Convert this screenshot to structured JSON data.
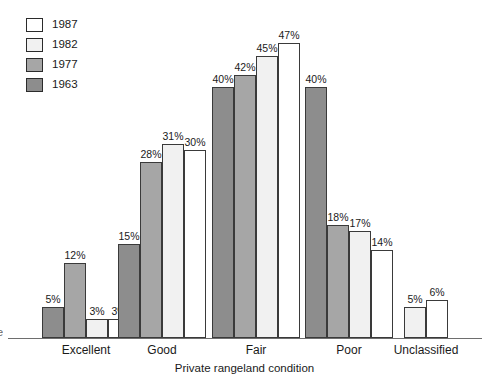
{
  "chart_data": {
    "type": "bar",
    "title": "",
    "xlabel": "Private rangeland condition",
    "ylabel": "",
    "grid": false,
    "legend_position": "top-left",
    "ylim": [
      0,
      50
    ],
    "value_suffix": "%",
    "categories": [
      "Excellent",
      "Good",
      "Fair",
      "Poor",
      "Unclassified"
    ],
    "series": [
      {
        "name": "1963",
        "color": "#8d8d8d",
        "values": [
          5,
          15,
          40,
          40,
          null
        ],
        "labels": [
          "5%",
          "15%",
          "40%",
          "40%",
          ""
        ]
      },
      {
        "name": "1977",
        "color": "#a6a6a6",
        "values": [
          12,
          28,
          42,
          18,
          null
        ],
        "labels": [
          "12%",
          "28%",
          "42%",
          "18%",
          ""
        ]
      },
      {
        "name": "1982",
        "color": "#f1f1f1",
        "values": [
          3,
          31,
          45,
          17,
          5
        ],
        "labels": [
          "3%",
          "31%",
          "45%",
          "17%",
          "5%"
        ]
      },
      {
        "name": "1987",
        "color": "#ffffff",
        "values": [
          3,
          30,
          47,
          14,
          6
        ],
        "labels": [
          "3%",
          "30%",
          "47%",
          "14%",
          "6%"
        ]
      }
    ]
  },
  "legend": {
    "items": [
      {
        "label": "1987",
        "color": "#ffffff"
      },
      {
        "label": "1982",
        "color": "#f1f1f1"
      },
      {
        "label": "1977",
        "color": "#a6a6a6"
      },
      {
        "label": "1963",
        "color": "#8d8d8d"
      }
    ]
  },
  "axis": {
    "x_title": "Private rangeland condition"
  },
  "edge": {
    "clipped_glyph": "e"
  }
}
